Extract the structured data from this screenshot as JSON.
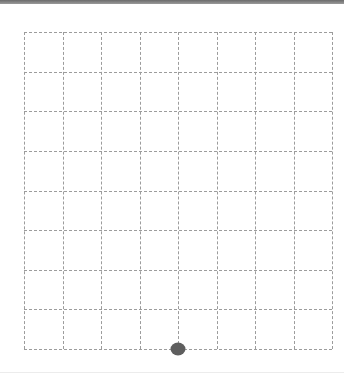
{
  "board": {
    "columns": 8,
    "rows": 8,
    "line_style": "dashed",
    "line_color": "#9c9c9c"
  },
  "pieces": [
    {
      "type": "dot",
      "color": "#5e5e5e",
      "grid_x": 4,
      "grid_y": 8
    }
  ]
}
